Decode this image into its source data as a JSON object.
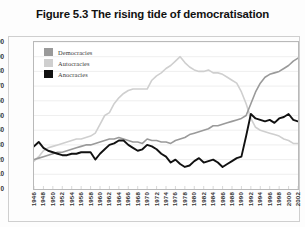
{
  "figure": {
    "title": "Figure 5.3 The rising tide of democratisation"
  },
  "axes": {
    "ylabel": "Number of countries",
    "yticks": [
      "100",
      "90",
      "80",
      "70",
      "60",
      "50",
      "40",
      "30",
      "20",
      "10",
      "0"
    ],
    "xticks": [
      "1946",
      "1948",
      "1950",
      "1952",
      "1954",
      "1956",
      "1958",
      "1960",
      "1962",
      "1964",
      "1966",
      "1968",
      "1970",
      "1972",
      "1974",
      "1976",
      "1978",
      "1980",
      "1982",
      "1984",
      "1986",
      "1988",
      "1990",
      "1992",
      "1994",
      "1996",
      "1998",
      "2000",
      "2002"
    ]
  },
  "legend": {
    "position": "top-left-inside",
    "items": [
      {
        "label": "Democracies",
        "color": "#9a9a9a"
      },
      {
        "label": "Autocracies",
        "color": "#cfcfcf"
      },
      {
        "label": "Anocracies",
        "color": "#111111"
      }
    ]
  },
  "chart_data": {
    "type": "line",
    "title": "Figure 5.3 The rising tide of democratisation",
    "xlabel": "",
    "ylabel": "Number of countries",
    "xlim": [
      1946,
      2002
    ],
    "ylim": [
      0,
      100
    ],
    "ytick_step": 10,
    "xtick_step": 2,
    "grid": true,
    "legend_position": "top-left-inside",
    "x": [
      1946,
      1947,
      1948,
      1949,
      1950,
      1951,
      1952,
      1953,
      1954,
      1955,
      1956,
      1957,
      1958,
      1959,
      1960,
      1961,
      1962,
      1963,
      1964,
      1965,
      1966,
      1967,
      1968,
      1969,
      1970,
      1971,
      1972,
      1973,
      1974,
      1975,
      1976,
      1977,
      1978,
      1979,
      1980,
      1981,
      1982,
      1983,
      1984,
      1985,
      1986,
      1987,
      1988,
      1989,
      1990,
      1991,
      1992,
      1993,
      1994,
      1995,
      1996,
      1997,
      1998,
      1999,
      2000,
      2001,
      2002
    ],
    "series": [
      {
        "name": "Democracies",
        "color": "#9a9a9a",
        "values": [
          20,
          21,
          22,
          23,
          24,
          25,
          25,
          26,
          27,
          28,
          29,
          30,
          30,
          31,
          32,
          33,
          34,
          34,
          35,
          34,
          33,
          32,
          32,
          31,
          34,
          33,
          33,
          32,
          32,
          31,
          33,
          34,
          35,
          37,
          38,
          39,
          40,
          41,
          43,
          43,
          44,
          45,
          46,
          47,
          48,
          50,
          58,
          66,
          72,
          76,
          78,
          79,
          80,
          82,
          84,
          87,
          89
        ]
      },
      {
        "name": "Autocracies",
        "color": "#cfcfcf",
        "values": [
          19,
          22,
          26,
          28,
          29,
          30,
          31,
          32,
          33,
          34,
          34,
          35,
          36,
          38,
          44,
          50,
          52,
          58,
          62,
          65,
          67,
          68,
          68,
          68,
          68,
          74,
          77,
          79,
          82,
          84,
          87,
          90,
          86,
          83,
          81,
          80,
          80,
          81,
          79,
          79,
          78,
          76,
          74,
          72,
          66,
          58,
          48,
          42,
          40,
          39,
          38,
          37,
          36,
          34,
          33,
          31,
          31
        ]
      },
      {
        "name": "Anocracies",
        "color": "#111111",
        "values": [
          29,
          32,
          28,
          26,
          25,
          24,
          23,
          23,
          24,
          24,
          25,
          25,
          25,
          20,
          24,
          27,
          30,
          31,
          33,
          33,
          30,
          28,
          26,
          27,
          30,
          29,
          27,
          24,
          22,
          18,
          20,
          17,
          15,
          16,
          19,
          21,
          18,
          19,
          20,
          18,
          15,
          17,
          19,
          21,
          22,
          36,
          51,
          48,
          47,
          46,
          47,
          45,
          48,
          49,
          51,
          47,
          46
        ]
      }
    ]
  }
}
